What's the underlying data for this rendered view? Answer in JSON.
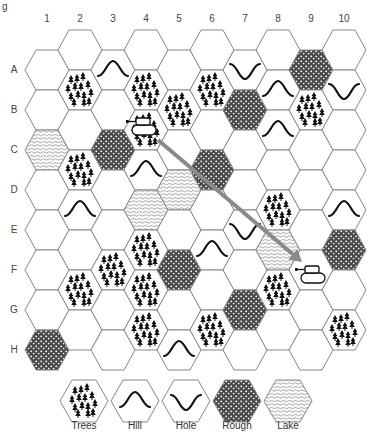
{
  "figure_label": "g",
  "columns": [
    "1",
    "2",
    "3",
    "4",
    "5",
    "6",
    "7",
    "8",
    "9",
    "10"
  ],
  "rows": [
    "A",
    "B",
    "C",
    "D",
    "E",
    "F",
    "G",
    "H"
  ],
  "colors": {
    "hex_stroke": "#888888",
    "rough_fill": "#555555",
    "arrow": "#8a8a8a",
    "ink": "#111111"
  },
  "grid": {
    "col1": [
      "blank",
      "blank",
      "lake",
      "blank",
      "blank",
      "blank",
      "blank",
      "rough"
    ],
    "col2": [
      "blank",
      "trees",
      "blank",
      "trees",
      "hill",
      "blank",
      "trees",
      "blank"
    ],
    "col3": [
      "hill",
      "blank",
      "rough",
      "blank",
      "blank",
      "trees",
      "blank",
      "blank"
    ],
    "col4": [
      "blank",
      "trees",
      "trees",
      "hill",
      "lake",
      "trees",
      "trees",
      "trees"
    ],
    "col5": [
      "blank",
      "trees",
      "blank",
      "lake",
      "blank",
      "rough",
      "blank",
      "hill"
    ],
    "col6": [
      "blank",
      "trees",
      "blank",
      "rough",
      "blank",
      "hill",
      "blank",
      "trees"
    ],
    "col7": [
      "hole",
      "rough",
      "blank",
      "blank",
      "hole",
      "blank",
      "rough",
      "blank"
    ],
    "col8": [
      "blank",
      "hill",
      "hill",
      "blank",
      "trees",
      "lake",
      "trees",
      "blank"
    ],
    "col9": [
      "rough",
      "trees",
      "blank",
      "blank",
      "blank",
      "blank",
      "blank",
      "blank"
    ],
    "col10": [
      "blank",
      "hole",
      "blank",
      "blank",
      "hill",
      "rough",
      "blank",
      "trees"
    ]
  },
  "units": [
    {
      "name": "tank-start",
      "col": 4,
      "slot": 2
    },
    {
      "name": "tank-target",
      "col": 9,
      "slot": 5
    }
  ],
  "arrow": {
    "from": [
      158,
      140
    ],
    "to": [
      302,
      262
    ]
  },
  "legend": [
    {
      "terrain": "trees",
      "label": "Trees"
    },
    {
      "terrain": "hill",
      "label": "Hill"
    },
    {
      "terrain": "hole",
      "label": "Hole"
    },
    {
      "terrain": "rough",
      "label": "Rough"
    },
    {
      "terrain": "lake",
      "label": "Lake"
    }
  ]
}
